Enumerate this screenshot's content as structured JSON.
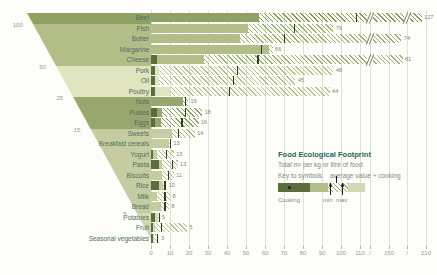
{
  "chart_data": {
    "type": "bar",
    "orientation": "horizontal",
    "title": "Food Ecological Footprint",
    "xlabel": "Total m² per kg or litre of food",
    "axis_ticks": [
      "0",
      "10",
      "20",
      "30",
      "40",
      "50",
      "60",
      "70",
      "80",
      "90",
      "100",
      "110",
      "/",
      "150",
      "/",
      "210"
    ],
    "axis_has_breaks": true,
    "categories": [
      "Beef",
      "Fish",
      "Butter",
      "Margarine",
      "Cheese",
      "Pork",
      "Oil",
      "Poultry",
      "Nuts",
      "Pulses",
      "Eggs",
      "Sweets",
      "Breakfast cereals",
      "Yogurt",
      "Pasta",
      "Biscuits",
      "Rice",
      "Milk",
      "Bread",
      "Potatoes",
      "Fruit",
      "Seasonal vegetables"
    ],
    "values": [
      127,
      79,
      74,
      66,
      61,
      48,
      45,
      44,
      19,
      18,
      16,
      14,
      13,
      13,
      13,
      11,
      10,
      8,
      8,
      5,
      5,
      3
    ],
    "rows": [
      {
        "label": "Beef",
        "value": "127",
        "group": 0,
        "cook": 0,
        "hatch_from": 57,
        "max": 203,
        "tick": 108
      },
      {
        "label": "Fish",
        "value": "79",
        "group": 1,
        "cook": 0,
        "hatch_from": 51,
        "max": 96,
        "tick": 75
      },
      {
        "label": "Butter",
        "value": "74",
        "group": 1,
        "cook": 0,
        "hatch_from": 47,
        "max": 170,
        "tick": 70
      },
      {
        "label": "Margarine",
        "value": "66",
        "group": 1,
        "cook": 0,
        "hatch_from": 62,
        "max": 64,
        "tick": 58
      },
      {
        "label": "Cheese",
        "value": "61",
        "group": 1,
        "cook": 3,
        "hatch_from": 28,
        "max": 172,
        "tick": 56
      },
      {
        "label": "Pork",
        "value": "48",
        "group": 2,
        "cook": 2,
        "hatch_from": 4,
        "max": 96,
        "tick": 45
      },
      {
        "label": "Oil",
        "value": "45",
        "group": 2,
        "cook": 2,
        "hatch_from": 4,
        "max": 76,
        "tick": 43
      },
      {
        "label": "Poultry",
        "value": "44",
        "group": 2,
        "cook": 2,
        "hatch_from": 10,
        "max": 94,
        "tick": 41
      },
      {
        "label": "Nuts",
        "value": "19",
        "group": 3,
        "cook": 0,
        "hatch_from": 17,
        "max": 19.5,
        "tick": 18
      },
      {
        "label": "Pulses",
        "value": "18",
        "group": 3,
        "cook": 3,
        "hatch_from": 6,
        "max": 27,
        "tick": 18
      },
      {
        "label": "Eggs",
        "value": "16",
        "group": 3,
        "cook": 2,
        "hatch_from": 5,
        "max": 25,
        "tick": 16
      },
      {
        "label": "Sweets",
        "value": "14",
        "group": 4,
        "cook": 0,
        "hatch_from": 11,
        "max": 23,
        "tick": 14
      },
      {
        "label": "Breakfast cereals",
        "value": "13",
        "group": 4,
        "cook": 0,
        "hatch_from": 9.5,
        "max": 10.5,
        "tick": 10
      },
      {
        "label": "Yogurt",
        "value": "13",
        "group": 4,
        "cook": 1,
        "hatch_from": 3,
        "max": 12,
        "tick": 8
      },
      {
        "label": "Pasta",
        "value": "13",
        "group": 4,
        "cook": 4,
        "hatch_from": 6,
        "max": 14,
        "tick": 11
      },
      {
        "label": "Biscuits",
        "value": "11",
        "group": 4,
        "cook": 0,
        "hatch_from": 6,
        "max": 12,
        "tick": 9
      },
      {
        "label": "Rice",
        "value": "10",
        "group": 4,
        "cook": 4,
        "hatch_from": 6.5,
        "max": 8,
        "tick": 7
      },
      {
        "label": "Milk",
        "value": "8",
        "group": 4,
        "cook": 0,
        "hatch_from": 3,
        "max": 10,
        "tick": 7
      },
      {
        "label": "Bread",
        "value": "8",
        "group": 4,
        "cook": 0,
        "hatch_from": 5,
        "max": 9.5,
        "tick": 7
      },
      {
        "label": "Potatoes",
        "value": "5",
        "group": 5,
        "cook": 2,
        "hatch_from": 3.5,
        "max": 4.5,
        "tick": 4
      },
      {
        "label": "Fruit",
        "value": "5",
        "group": 5,
        "cook": 1,
        "hatch_from": 2,
        "max": 19,
        "tick": 5
      },
      {
        "label": "Seasonal vegetables",
        "value": "3",
        "group": 5,
        "cook": 1,
        "hatch_from": 1.5,
        "max": 4,
        "tick": 3
      }
    ],
    "group_bands": [
      {
        "rows": 1,
        "boundary_label": "100"
      },
      {
        "rows": 4,
        "boundary_label": "50"
      },
      {
        "rows": 3,
        "boundary_label": "25"
      },
      {
        "rows": 3,
        "boundary_label": "15"
      },
      {
        "rows": 8,
        "boundary_label": "5"
      },
      {
        "rows": 3,
        "boundary_label": ""
      }
    ]
  },
  "legend": {
    "title": "Food Ecological Footprint",
    "subtitle": "Total m² per kg or litre of food",
    "key_label": "Key to symbols",
    "average_label": "average value + cooking",
    "cooking_label": "Cooking",
    "min_label": "min",
    "max_label": "max"
  },
  "colors": {
    "background": "#fdfdfa",
    "groups": [
      "#90a164",
      "#b2bd88",
      "#e0e4bf",
      "#98a76e",
      "#c5cda0",
      "#d2d8b4"
    ],
    "hatch": [
      "#879757",
      "#9fae73",
      "#b6c08e",
      "#8f9f64",
      "#aeb884",
      "#b5bd8e"
    ],
    "cooking": "#5c6d3c",
    "avg_tick": "#333d1f",
    "grid": "#dde3d1",
    "value_text": "#7d8a6d",
    "label_text": "#4d6e62",
    "axis_text": "#9a9a90",
    "legend_title_text": "#27655c",
    "legend_text": "#7d8c7c"
  }
}
